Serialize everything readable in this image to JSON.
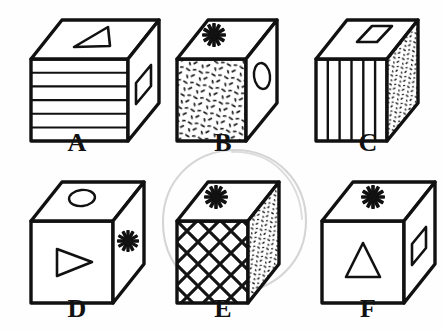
{
  "figure": {
    "background_color": "#fefefe",
    "ink_color": "#111111",
    "annotation_color": "#cfcfcf",
    "label_font_style": "bold serif",
    "rows": 2,
    "columns": 3,
    "annotation": {
      "name": "hand-drawn-circle",
      "targets": "E",
      "shape": "ellipse",
      "cx": 234,
      "cy": 222,
      "rx": 72,
      "ry": 72,
      "color": "#d2d2d2"
    },
    "cubes": [
      {
        "label": "A",
        "label_x": 57,
        "label_y": 130,
        "origin_x": 28,
        "origin_y": 16,
        "top_pattern": "triangle-outline",
        "front_pattern": "horizontal-stripes",
        "front_stripe_count": 6,
        "right_pattern": "parallelogram-outline"
      },
      {
        "label": "B",
        "label_x": 203,
        "label_y": 130,
        "origin_x": 175,
        "origin_y": 16,
        "top_pattern": "star-asterisk",
        "front_pattern": "speckle-dashes",
        "right_pattern": "oval-outline"
      },
      {
        "label": "C",
        "label_x": 348,
        "label_y": 130,
        "origin_x": 320,
        "origin_y": 16,
        "top_pattern": "diamond-outline",
        "front_pattern": "vertical-stripes",
        "front_stripe_count": 6,
        "right_pattern": "speckle-dots"
      },
      {
        "label": "D",
        "label_x": 57,
        "label_y": 296,
        "origin_x": 28,
        "origin_y": 178,
        "top_pattern": "oval-outline",
        "front_pattern": "triangle-right-pointing",
        "right_pattern": "star-asterisk"
      },
      {
        "label": "E",
        "label_x": 203,
        "label_y": 296,
        "origin_x": 175,
        "origin_y": 178,
        "top_pattern": "star-asterisk",
        "front_pattern": "cross-hatch-lattice",
        "right_pattern": "speckle-dots"
      },
      {
        "label": "F",
        "label_x": 348,
        "label_y": 296,
        "origin_x": 320,
        "origin_y": 178,
        "top_pattern": "star-asterisk",
        "front_pattern": "triangle-up-pointing",
        "right_pattern": "parallelogram-outline"
      }
    ]
  }
}
